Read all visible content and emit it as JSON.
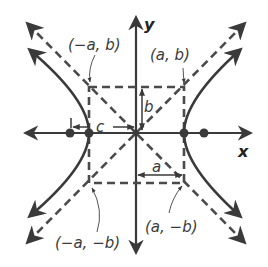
{
  "diagram": {
    "axes": {
      "x_label": "x",
      "y_label": "y"
    },
    "points": {
      "upper_left": "(−a, b)",
      "upper_right": "(a, b)",
      "lower_left": "(−a, −b)",
      "lower_right": "(a, −b)"
    },
    "distances": {
      "c": "c",
      "b": "b",
      "a": "a"
    },
    "colors": {
      "curve": "#3a3a3a",
      "dashed": "#4a4a4a",
      "axis": "#3a3a3a"
    }
  }
}
